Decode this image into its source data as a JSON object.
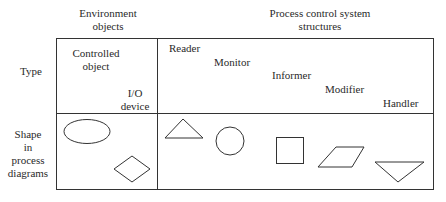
{
  "headers": {
    "environment": [
      "Environment",
      "objects"
    ],
    "process": [
      "Process control system",
      "structures"
    ]
  },
  "rows": {
    "type": "Type",
    "shape": [
      "Shape",
      "in",
      "process",
      "diagrams"
    ]
  },
  "environment_objects": [
    {
      "label": [
        "Controlled",
        "object"
      ],
      "shape": "ellipse"
    },
    {
      "label": [
        "I/O",
        "device"
      ],
      "shape": "diamond"
    }
  ],
  "structures": [
    {
      "label": "Reader",
      "shape": "triangle-up"
    },
    {
      "label": "Monitor",
      "shape": "circle"
    },
    {
      "label": "Informer",
      "shape": "square"
    },
    {
      "label": "Modifier",
      "shape": "parallelogram"
    },
    {
      "label": "Handler",
      "shape": "triangle-down"
    }
  ],
  "colors": {
    "line": "#333333",
    "text": "#2a2a2a",
    "background": "#ffffff"
  }
}
